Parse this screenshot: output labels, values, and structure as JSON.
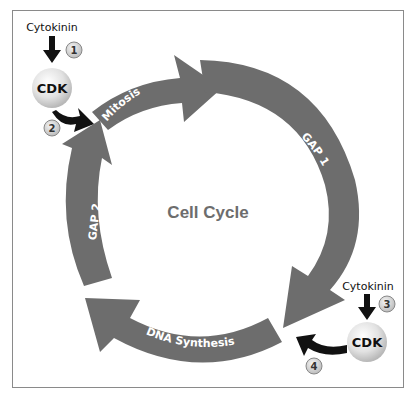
{
  "diagram": {
    "title": "Cell Cycle",
    "colors": {
      "segment": "#6d6d6d",
      "center_text": "#6d6d6d",
      "arrow_black": "#111111",
      "frame": "#8a8a8a"
    },
    "segments": [
      {
        "label": "Mitosis"
      },
      {
        "label": "GAP 1"
      },
      {
        "label": "DNA Synthesis"
      },
      {
        "label": "GAP 2"
      }
    ],
    "regulators": [
      {
        "signal": "Cytokinin",
        "enzyme": "CDK",
        "step_in": "1",
        "step_out": "2",
        "position": "top-left"
      },
      {
        "signal": "Cytokinin",
        "enzyme": "CDK",
        "step_in": "3",
        "step_out": "4",
        "position": "bottom-right"
      }
    ]
  }
}
